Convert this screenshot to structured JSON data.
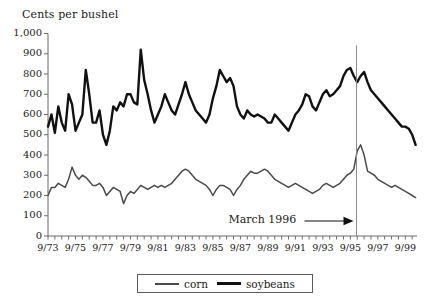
{
  "chart_data": {
    "type": "line",
    "title": "",
    "ylabel": "Cents per bushel",
    "xlabel": "",
    "ylim": [
      0,
      1000
    ],
    "ytick_labels": [
      "1,000",
      "900",
      "800",
      "700",
      "600",
      "500",
      "400",
      "300",
      "200",
      "100",
      "0"
    ],
    "ytick_values": [
      1000,
      900,
      800,
      700,
      600,
      500,
      400,
      300,
      200,
      100,
      0
    ],
    "grid": false,
    "legend_position": "bottom-center",
    "xtick_labels": [
      "9/73",
      "9/75",
      "9/77",
      "9/79",
      "9/81",
      "9/83",
      "9/85",
      "9/87",
      "9/89",
      "9/91",
      "9/93",
      "9/95",
      "9/97",
      "9/99"
    ],
    "xtick_values": [
      1973.75,
      1975.75,
      1977.75,
      1979.75,
      1981.75,
      1983.75,
      1985.75,
      1987.75,
      1989.75,
      1991.75,
      1993.75,
      1995.75,
      1997.75,
      1999.75
    ],
    "x_range": [
      1973.75,
      2000.6
    ],
    "minor_tick_interval_years": 0.5,
    "annotations": [
      {
        "text": "March 1996",
        "x": 1996.2,
        "kind": "vertical-line-with-arrow",
        "arrow_direction": "right"
      }
    ],
    "legend": [
      {
        "name": "corn",
        "color": "#4a4a4a",
        "width": 1.6
      },
      {
        "name": "soybeans",
        "color": "#111111",
        "width": 2.6
      }
    ],
    "x": [
      1973.75,
      1974.0,
      1974.25,
      1974.5,
      1974.75,
      1975.0,
      1975.25,
      1975.5,
      1975.75,
      1976.0,
      1976.25,
      1976.5,
      1976.75,
      1977.0,
      1977.25,
      1977.5,
      1977.75,
      1978.0,
      1978.25,
      1978.5,
      1978.75,
      1979.0,
      1979.25,
      1979.5,
      1979.75,
      1980.0,
      1980.25,
      1980.5,
      1980.75,
      1981.0,
      1981.25,
      1981.5,
      1981.75,
      1982.0,
      1982.25,
      1982.5,
      1982.75,
      1983.0,
      1983.25,
      1983.5,
      1983.75,
      1984.0,
      1984.25,
      1984.5,
      1984.75,
      1985.0,
      1985.25,
      1985.5,
      1985.75,
      1986.0,
      1986.25,
      1986.5,
      1986.75,
      1987.0,
      1987.25,
      1987.5,
      1987.75,
      1988.0,
      1988.25,
      1988.5,
      1988.75,
      1989.0,
      1989.25,
      1989.5,
      1989.75,
      1990.0,
      1990.25,
      1990.5,
      1990.75,
      1991.0,
      1991.25,
      1991.5,
      1991.75,
      1992.0,
      1992.25,
      1992.5,
      1992.75,
      1993.0,
      1993.25,
      1993.5,
      1993.75,
      1994.0,
      1994.25,
      1994.5,
      1994.75,
      1995.0,
      1995.25,
      1995.5,
      1995.75,
      1996.0,
      1996.25,
      1996.5,
      1996.75,
      1997.0,
      1997.25,
      1997.5,
      1997.75,
      1998.0,
      1998.25,
      1998.5,
      1998.75,
      1999.0,
      1999.25,
      1999.5,
      1999.75,
      2000.0,
      2000.25,
      2000.5
    ],
    "series": [
      {
        "name": "soybeans",
        "color": "#111111",
        "values": [
          540,
          600,
          510,
          640,
          560,
          520,
          700,
          650,
          520,
          560,
          600,
          820,
          700,
          560,
          560,
          620,
          500,
          450,
          520,
          640,
          620,
          660,
          640,
          700,
          700,
          660,
          650,
          920,
          770,
          700,
          620,
          560,
          600,
          640,
          700,
          660,
          620,
          600,
          650,
          700,
          760,
          700,
          660,
          620,
          600,
          580,
          560,
          600,
          680,
          740,
          820,
          790,
          760,
          780,
          740,
          640,
          600,
          580,
          620,
          600,
          590,
          600,
          590,
          580,
          560,
          560,
          600,
          580,
          560,
          540,
          520,
          560,
          600,
          620,
          650,
          700,
          690,
          640,
          620,
          660,
          700,
          720,
          690,
          700,
          720,
          740,
          790,
          820,
          830,
          790,
          760,
          790,
          810,
          760,
          720,
          700,
          680,
          660,
          640,
          620,
          600,
          580,
          560,
          540,
          540,
          530,
          500,
          450
        ]
      },
      {
        "name": "corn",
        "color": "#4a4a4a",
        "values": [
          200,
          240,
          240,
          260,
          250,
          240,
          280,
          340,
          300,
          280,
          300,
          290,
          270,
          250,
          250,
          260,
          240,
          200,
          220,
          240,
          230,
          220,
          160,
          200,
          220,
          210,
          230,
          250,
          240,
          230,
          240,
          250,
          240,
          250,
          240,
          250,
          260,
          280,
          300,
          320,
          330,
          320,
          300,
          280,
          270,
          260,
          250,
          230,
          200,
          230,
          250,
          250,
          240,
          230,
          200,
          230,
          250,
          280,
          300,
          320,
          310,
          310,
          320,
          330,
          320,
          300,
          280,
          270,
          260,
          250,
          240,
          250,
          260,
          250,
          240,
          230,
          220,
          210,
          220,
          230,
          250,
          260,
          250,
          240,
          250,
          260,
          280,
          300,
          310,
          330,
          420,
          450,
          400,
          320,
          310,
          300,
          280,
          270,
          260,
          250,
          240,
          250,
          240,
          230,
          220,
          210,
          200,
          190
        ]
      }
    ]
  },
  "icons": {
    "arrow": "arrow-right-icon"
  }
}
